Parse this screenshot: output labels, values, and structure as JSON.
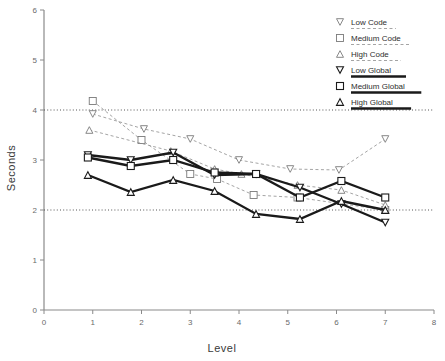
{
  "chart_data": {
    "type": "line",
    "title": "",
    "xlabel": "Level",
    "ylabel": "Seconds",
    "xlim": [
      0,
      8
    ],
    "ylim": [
      0,
      6
    ],
    "xticks": [
      0,
      1,
      2,
      3,
      4,
      5,
      6,
      7,
      8
    ],
    "yticks": [
      0,
      1,
      2,
      3,
      4,
      5,
      6
    ],
    "grid": "horizontal dotted gridlines at y=2 and y=4 only",
    "gridlines": [
      2,
      4
    ],
    "legend_position": "top-right inside plot area",
    "x": [
      1,
      2,
      3,
      4,
      5,
      6,
      7
    ],
    "series": [
      {
        "name": "Low Code",
        "marker": "triangle-down",
        "linestyle": "dashed",
        "color": "#8a8a8a",
        "x": [
          1.0,
          2.05,
          3.0,
          4.0,
          5.05,
          6.05,
          7.0
        ],
        "values": [
          3.92,
          3.62,
          3.42,
          3.0,
          2.82,
          2.8,
          3.42
        ]
      },
      {
        "name": "Medium Code",
        "marker": "square",
        "linestyle": "dashed",
        "color": "#8a8a8a",
        "x": [
          1.0,
          2.0,
          3.0,
          3.55,
          4.3,
          5.2,
          7.0
        ],
        "values": [
          4.18,
          3.4,
          2.72,
          2.62,
          2.3,
          2.25,
          2.0
        ]
      },
      {
        "name": "High Code",
        "marker": "triangle-up",
        "linestyle": "dashed",
        "color": "#8a8a8a",
        "x": [
          0.93,
          2.6,
          3.5,
          4.05,
          5.2,
          6.1,
          7.0
        ],
        "values": [
          3.6,
          3.18,
          2.82,
          2.72,
          2.5,
          2.4,
          2.1
        ]
      },
      {
        "name": "Low Global",
        "marker": "triangle-down",
        "linestyle": "solid",
        "color": "#1a1a1a",
        "x": [
          0.9,
          1.78,
          2.65,
          3.5,
          4.35,
          5.25,
          6.1,
          7.0
        ],
        "values": [
          3.1,
          3.0,
          3.15,
          2.7,
          2.72,
          2.45,
          2.12,
          1.75
        ]
      },
      {
        "name": "Medium Global",
        "marker": "square",
        "linestyle": "solid",
        "color": "#1a1a1a",
        "x": [
          0.9,
          1.78,
          2.65,
          3.5,
          4.35,
          5.25,
          6.1,
          7.0
        ],
        "values": [
          3.05,
          2.88,
          3.0,
          2.75,
          2.72,
          2.25,
          2.58,
          2.25
        ]
      },
      {
        "name": "High Global",
        "marker": "triangle-up",
        "linestyle": "solid",
        "color": "#1a1a1a",
        "x": [
          0.9,
          1.78,
          2.65,
          3.5,
          4.35,
          5.25,
          6.1,
          7.0
        ],
        "values": [
          2.7,
          2.36,
          2.6,
          2.38,
          1.92,
          1.82,
          2.18,
          2.0
        ]
      }
    ]
  },
  "axes": {
    "x_title": "Level",
    "y_title": "Seconds",
    "x_tick_labels": [
      "0",
      "1",
      "2",
      "3",
      "4",
      "5",
      "6",
      "7",
      "8"
    ],
    "y_tick_labels": [
      "0",
      "1",
      "2",
      "3",
      "4",
      "5",
      "6"
    ]
  },
  "legend": {
    "items": [
      {
        "label": "Low Code",
        "marker": "triangle-down",
        "style": "dashed"
      },
      {
        "label": "Medium Code",
        "marker": "square",
        "style": "dashed"
      },
      {
        "label": "High Code",
        "marker": "triangle-up",
        "style": "dashed"
      },
      {
        "label": "Low Global",
        "marker": "triangle-down",
        "style": "solid"
      },
      {
        "label": "Medium Global",
        "marker": "square",
        "style": "solid"
      },
      {
        "label": "High Global",
        "marker": "triangle-up",
        "style": "solid"
      }
    ]
  },
  "colors": {
    "code_line": "#9a9a9a",
    "global_line": "#1a1a1a",
    "axis": "#8a8a8a",
    "grid": "#555555",
    "text": "#3a3a3a"
  }
}
